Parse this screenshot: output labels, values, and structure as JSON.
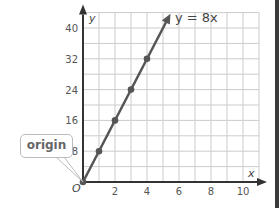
{
  "chart_data": {
    "type": "line",
    "title": "",
    "equation_label": "y = 8x",
    "xlabel": "x",
    "ylabel": "y",
    "xlim": [
      0,
      11
    ],
    "ylim": [
      0,
      44
    ],
    "x_ticks": [
      2,
      4,
      6,
      8,
      10
    ],
    "y_ticks": [
      8,
      16,
      24,
      32,
      40
    ],
    "origin_label": "O",
    "grid": true,
    "series": [
      {
        "name": "y = 8x",
        "x": [
          0,
          1,
          2,
          3,
          4
        ],
        "y": [
          0,
          8,
          16,
          24,
          32
        ],
        "color": "#555555"
      }
    ],
    "annotations": [
      {
        "text": "origin",
        "points_to": [
          0,
          0
        ]
      }
    ]
  },
  "callout": {
    "text": "origin"
  },
  "colors": {
    "line": "#555555",
    "grid": "#cccccc",
    "axis": "#333333"
  }
}
